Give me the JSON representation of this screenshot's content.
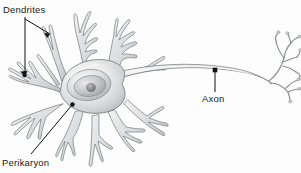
{
  "figure": {
    "style": "grayscale shaded line drawing",
    "background_color": "#fdfdfd",
    "outline_color": "#6f7274",
    "fill_light": "#f4f4f4",
    "fill_mid": "#cfd1d2",
    "fill_dark": "#9a9c9e",
    "nucleolus_color": "#7e8183",
    "leader_color": "#111111"
  },
  "labels": {
    "dendrites": {
      "text": "Dendrites",
      "target_part": "dendrite-branches",
      "pointer_type": "bracket-with-two-arrows",
      "x": 3,
      "y": 5
    },
    "perikaryon": {
      "text": "Perikaryon",
      "target_part": "cell-body-soma",
      "pointer_type": "diagonal-arrow-with-dot",
      "x": 2,
      "y": 158
    },
    "axon": {
      "text": "Axon",
      "target_part": "axon-shaft",
      "pointer_type": "vertical-line-with-dot",
      "x": 202,
      "y": 94
    }
  },
  "parts": [
    {
      "name": "dendrites",
      "label": "Dendrites",
      "count_visible": 9
    },
    {
      "name": "perikaryon",
      "label": "Perikaryon"
    },
    {
      "name": "nucleus",
      "label": ""
    },
    {
      "name": "nucleolus",
      "label": ""
    },
    {
      "name": "axon",
      "label": "Axon"
    },
    {
      "name": "axon-terminals",
      "label": ""
    }
  ]
}
